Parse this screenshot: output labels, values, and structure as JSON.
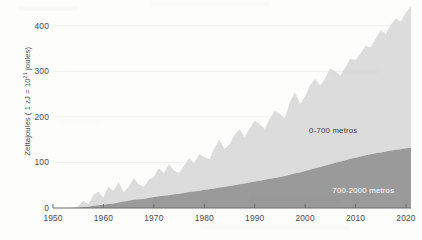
{
  "chart_data": {
    "type": "area",
    "title": "",
    "subtitle": "",
    "xlabel": "",
    "ylabel": "Zettajoules ( 1 zJ = 10",
    "ylabel_exponent": "21",
    "ylabel_suffix": " joules)",
    "xlim": [
      1950,
      2021
    ],
    "ylim": [
      0,
      430
    ],
    "grid": true,
    "legend_position": "inline",
    "xticks": [
      1950,
      1960,
      1970,
      1980,
      1990,
      2000,
      2010,
      2020
    ],
    "yticks": [
      0,
      100,
      200,
      300,
      400
    ],
    "x": [
      1950,
      1951,
      1952,
      1953,
      1954,
      1955,
      1956,
      1957,
      1958,
      1959,
      1960,
      1961,
      1962,
      1963,
      1964,
      1965,
      1966,
      1967,
      1968,
      1969,
      1970,
      1971,
      1972,
      1973,
      1974,
      1975,
      1976,
      1977,
      1978,
      1979,
      1980,
      1981,
      1982,
      1983,
      1984,
      1985,
      1986,
      1987,
      1988,
      1989,
      1990,
      1991,
      1992,
      1993,
      1994,
      1995,
      1996,
      1997,
      1998,
      1999,
      2000,
      2001,
      2002,
      2003,
      2004,
      2005,
      2006,
      2007,
      2008,
      2009,
      2010,
      2011,
      2012,
      2013,
      2014,
      2015,
      2016,
      2017,
      2018,
      2019,
      2020,
      2021
    ],
    "series": [
      {
        "name": "0-700 metros",
        "color": "#dcdcdc",
        "values": [
          0,
          0,
          0,
          0,
          1,
          3,
          14,
          6,
          23,
          30,
          16,
          38,
          27,
          45,
          21,
          30,
          48,
          33,
          26,
          40,
          44,
          62,
          50,
          68,
          52,
          46,
          60,
          74,
          62,
          80,
          72,
          66,
          88,
          104,
          84,
          92,
          110,
          120,
          102,
          118,
          134,
          124,
          112,
          132,
          148,
          138,
          126,
          160,
          178,
          150,
          164,
          186,
          196,
          178,
          192,
          210,
          200,
          188,
          204,
          220,
          214,
          226,
          240,
          234,
          252,
          268,
          258,
          276,
          288,
          280,
          298,
          310
        ]
      },
      {
        "name": "700-2000 metros",
        "color": "#9a9a9a",
        "values": [
          0,
          0,
          0,
          0,
          0,
          1,
          2,
          3,
          5,
          6,
          7,
          9,
          10,
          12,
          14,
          16,
          18,
          19,
          20,
          22,
          24,
          26,
          27,
          28,
          30,
          31,
          33,
          35,
          36,
          38,
          40,
          41,
          43,
          45,
          46,
          48,
          50,
          52,
          54,
          56,
          58,
          60,
          62,
          64,
          66,
          68,
          70,
          73,
          76,
          78,
          81,
          84,
          87,
          90,
          93,
          96,
          99,
          102,
          105,
          108,
          110,
          113,
          116,
          118,
          120,
          122,
          124,
          126,
          128,
          129,
          131,
          132
        ]
      }
    ],
    "inline_labels": [
      {
        "text": "0-700 metros",
        "series": "0-700 metros"
      },
      {
        "text": "700-2000 metros",
        "series": "700-2000 metros"
      }
    ]
  }
}
